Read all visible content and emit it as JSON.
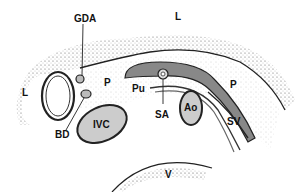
{
  "labels": {
    "L_top": "L",
    "L_left": "L",
    "GDA": "GDA",
    "P_left": "P",
    "Pu": "Pu",
    "P_right": "P",
    "BD": "BD",
    "IVC": "IVC",
    "SA": "SA",
    "Ao": "Ao",
    "SV": "SV",
    "V": "V"
  }
}
